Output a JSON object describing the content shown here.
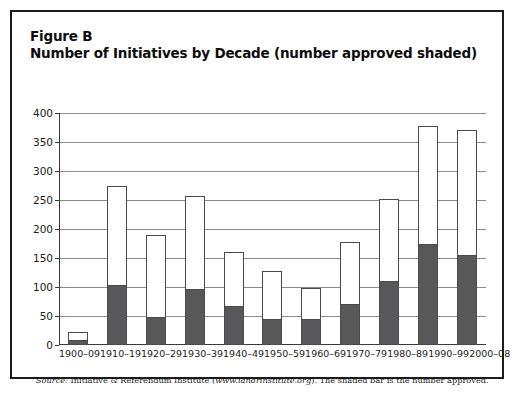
{
  "figure": {
    "label": "Figure B",
    "title": "Number of Initiatives by Decade (number approved shaded)",
    "source_prefix": "Source:",
    "source_body": " Initiative & Referendum Institute (",
    "source_url": "www.iandrinstitute.org",
    "source_suffix": "). The shaded bar is the number approved."
  },
  "colors": {
    "approved_fill": "#58585a",
    "total_fill": "#ffffff",
    "bar_outline": "#4a4a4a",
    "gridline": "#8c8c8c",
    "frame": "#1b1b1b"
  },
  "chart_data": {
    "type": "bar",
    "title": "Number of Initiatives by Decade (number approved shaded)",
    "xlabel": "",
    "ylabel": "",
    "ylim": [
      0,
      400
    ],
    "ytick_values": [
      0,
      50,
      100,
      150,
      200,
      250,
      300,
      350,
      400
    ],
    "ytick_labels": [
      "0",
      "50",
      "100",
      "150",
      "200",
      "250",
      "300",
      "350",
      "400"
    ],
    "grid": true,
    "legend": "none",
    "stacked": true,
    "categories": [
      "1900–09",
      "1910–19",
      "1920–29",
      "1930–39",
      "1940–49",
      "1950–59",
      "1960–69",
      "1970–79",
      "1980–89",
      "1990–99",
      "2000–08"
    ],
    "series": [
      {
        "name": "Number of initiatives",
        "values": [
          22,
          274,
          190,
          257,
          160,
          127,
          99,
          178,
          252,
          378,
          370
        ]
      },
      {
        "name": "Number approved",
        "values": [
          8,
          103,
          49,
          97,
          68,
          45,
          45,
          70,
          110,
          175,
          155
        ]
      }
    ]
  }
}
